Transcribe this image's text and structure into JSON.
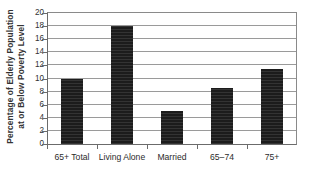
{
  "chart_data": {
    "type": "bar",
    "title": "",
    "xlabel": "",
    "ylabel": "Percentage of Elderly Population at or Below Poverty Level",
    "ylabel_lines": [
      "Percentage of Elderly Population",
      "at or Below Poverty Level"
    ],
    "categories": [
      "65+ Total",
      "Living Alone",
      "Married",
      "65–74",
      "75+"
    ],
    "values": [
      10.0,
      18.0,
      5.0,
      8.6,
      11.5
    ],
    "ylim": [
      0,
      20
    ],
    "ytick_values": [
      0,
      2,
      4,
      6,
      8,
      10,
      12,
      14,
      16,
      18,
      20
    ],
    "ytick_labels": [
      "0",
      "2",
      "4",
      "6",
      "8",
      "10",
      "12",
      "14",
      "16",
      "18",
      "20"
    ],
    "grid": true,
    "legend": null,
    "bar_color": "#1c1c1c",
    "gridline_color": "#9a9a9a",
    "axis_color": "#6b6b6b",
    "background_color": "#ffffff"
  }
}
